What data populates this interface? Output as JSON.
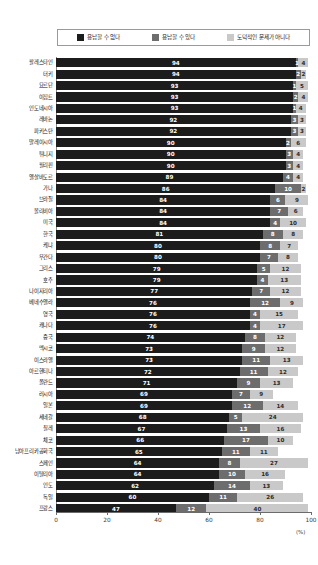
{
  "legend": {
    "position": "top",
    "items": [
      {
        "label": "용납할 수 없다",
        "color": "#1c1c1c",
        "icon": "legend-swatch-icon"
      },
      {
        "label": "용납할 수 있다",
        "color": "#6d6d6d",
        "icon": "legend-swatch-icon"
      },
      {
        "label": "도덕적인 문제가 아니다",
        "color": "#c9c9c9",
        "icon": "legend-swatch-icon"
      }
    ]
  },
  "axis": {
    "unit": "(%)",
    "ticks": [
      "0",
      "20",
      "40",
      "60",
      "80",
      "100"
    ]
  },
  "chart_data": {
    "type": "bar",
    "subtype": "stacked-horizontal",
    "title": "",
    "subtitle": "",
    "xlabel": "(%)",
    "ylabel": "",
    "xlim": [
      0,
      100
    ],
    "grid": false,
    "legend_position": "top",
    "categories": [
      "팔레스타인",
      "터키",
      "요르단",
      "이집트",
      "인도네시아",
      "레바논",
      "파키스탄",
      "말레이시아",
      "튀니지",
      "필리핀",
      "엘살바도르",
      "가나",
      "브라질",
      "볼리비아",
      "미국",
      "한국",
      "케냐",
      "우간다",
      "그리스",
      "호주",
      "나이지리아",
      "베네수엘라",
      "영국",
      "캐나다",
      "중국",
      "멕시코",
      "이스라엘",
      "아르헨티나",
      "폴란드",
      "러시아",
      "일본",
      "세네갈",
      "칠레",
      "체코",
      "남아프리카공화국",
      "스페인",
      "이탈리아",
      "인도",
      "독일",
      "프랑스"
    ],
    "series": [
      {
        "name": "용납할 수 없다",
        "color": "#1c1c1c",
        "values": [
          94,
          94,
          93,
          93,
          93,
          92,
          92,
          90,
          90,
          90,
          89,
          86,
          84,
          84,
          84,
          81,
          80,
          80,
          79,
          79,
          77,
          76,
          76,
          76,
          74,
          73,
          73,
          72,
          71,
          69,
          69,
          68,
          67,
          66,
          65,
          64,
          64,
          62,
          60,
          47
        ]
      },
      {
        "name": "용납할 수 있다",
        "color": "#6d6d6d",
        "values": [
          1,
          2,
          1,
          2,
          1,
          3,
          3,
          2,
          3,
          3,
          4,
          10,
          6,
          7,
          4,
          8,
          8,
          7,
          5,
          4,
          7,
          12,
          4,
          4,
          8,
          9,
          11,
          11,
          9,
          7,
          12,
          5,
          13,
          17,
          11,
          8,
          10,
          14,
          11,
          12
        ]
      },
      {
        "name": "도덕적인 문제가 아니다",
        "color": "#c9c9c9",
        "values": [
          4,
          2,
          5,
          4,
          4,
          3,
          3,
          6,
          4,
          4,
          4,
          2,
          9,
          6,
          10,
          8,
          7,
          8,
          12,
          13,
          12,
          9,
          15,
          17,
          12,
          12,
          13,
          12,
          13,
          9,
          14,
          24,
          16,
          10,
          11,
          27,
          16,
          13,
          26,
          40
        ]
      }
    ]
  }
}
